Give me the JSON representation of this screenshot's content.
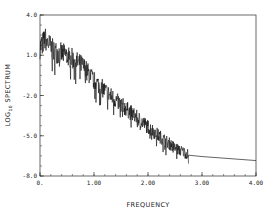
{
  "chart_data": {
    "type": "line",
    "title": "",
    "xlabel": "FREQUENCY",
    "ylabel": "LOG10 SPECTRUM",
    "ylabel_parts": {
      "pre": "LOG",
      "sub": "10",
      "post": " SPECTRUM"
    },
    "xlim": [
      0,
      4
    ],
    "ylim": [
      -8,
      4
    ],
    "x_ticks": [
      0,
      1,
      2,
      3,
      4
    ],
    "x_tick_labels": [
      "0.",
      "1.00",
      "2.00",
      "3.00",
      "4.00"
    ],
    "y_ticks": [
      4,
      1,
      -2,
      -5,
      -8
    ],
    "y_tick_labels": [
      "4.0",
      "1.0",
      "-2.0",
      "-5.0",
      "-8.0"
    ],
    "grid": false,
    "legend": null,
    "series": [
      {
        "name": "noisy spectrum",
        "style": "jagged",
        "x_range": [
          0.0,
          2.75
        ],
        "trend": [
          [
            0.0,
            1.6
          ],
          [
            0.1,
            2.2
          ],
          [
            0.25,
            1.3
          ],
          [
            0.5,
            1.0
          ],
          [
            0.8,
            0.2
          ],
          [
            1.0,
            -0.9
          ],
          [
            1.3,
            -2.0
          ],
          [
            1.6,
            -3.0
          ],
          [
            1.9,
            -4.0
          ],
          [
            2.2,
            -5.0
          ],
          [
            2.5,
            -5.9
          ],
          [
            2.75,
            -6.4
          ]
        ],
        "noise_amplitude": 0.9
      },
      {
        "name": "smooth tail",
        "style": "smooth",
        "points": [
          [
            2.75,
            -6.45
          ],
          [
            3.0,
            -6.55
          ],
          [
            3.5,
            -6.7
          ],
          [
            4.0,
            -6.85
          ]
        ]
      }
    ]
  }
}
